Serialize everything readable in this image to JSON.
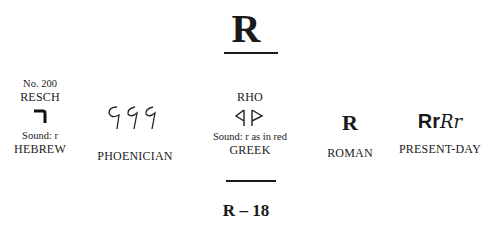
{
  "header": {
    "letter": "R"
  },
  "columns": {
    "hebrew": {
      "number": "No. 200",
      "name": "RESCH",
      "sound": "Sound: r",
      "label": "HEBREW"
    },
    "phoenician": {
      "label": "PHOENICIAN"
    },
    "greek": {
      "name": "RHO",
      "sound": "Sound: r as in red",
      "label": "GREEK"
    },
    "roman": {
      "glyph": "R",
      "label": "ROMAN"
    },
    "present_day": {
      "glyph_print": "Rr",
      "glyph_script": "Rr",
      "label": "PRESENT-DAY"
    }
  },
  "footer": {
    "page_code": "R – 18"
  }
}
